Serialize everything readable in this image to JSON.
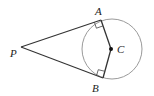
{
  "diagram": {
    "type": "geometry",
    "labels": {
      "P": "P",
      "A": "A",
      "B": "B",
      "C": "C"
    },
    "points": {
      "P": [
        21,
        47
      ],
      "A": [
        101,
        20
      ],
      "B": [
        103,
        78
      ],
      "C": [
        111,
        49
      ]
    },
    "circle": {
      "cx": 112,
      "cy": 49,
      "r": 30
    },
    "segments": [
      [
        "P",
        "A"
      ],
      [
        "P",
        "B"
      ],
      [
        "A",
        "C"
      ],
      [
        "B",
        "C"
      ]
    ],
    "right_angles": [
      "A",
      "B"
    ],
    "colors": {
      "circle": "#9a9a9a",
      "lines": "#333333",
      "center_dot": "#111111"
    }
  }
}
